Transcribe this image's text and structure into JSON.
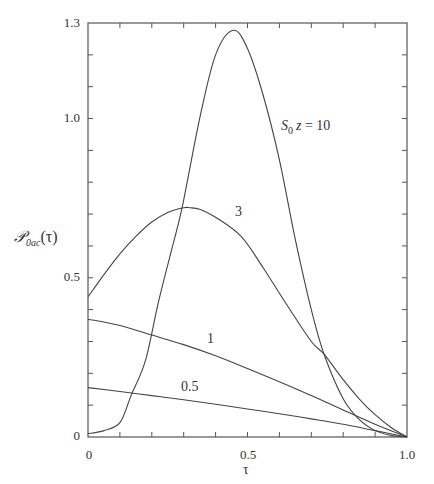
{
  "chart_data": {
    "type": "line",
    "title": "",
    "xlabel": "τ",
    "ylabel": "𝒫0ac(τ)",
    "ylabel_parts": {
      "main": "𝒫",
      "sub": "0ac",
      "arg": "(τ)"
    },
    "xlim": [
      0,
      1.0
    ],
    "ylim": [
      0,
      1.3
    ],
    "grid": false,
    "legend": "inline curve labels",
    "x_ticks_labeled": [
      "0",
      "0.5",
      "1.0"
    ],
    "y_ticks_labeled": [
      "0",
      "0.5",
      "1.0",
      "1.3"
    ],
    "minor_tick_step": 0.1,
    "series": [
      {
        "name": "S0z = 10",
        "label_parts": {
          "s": "S",
          "sub": "0",
          "z": "z",
          "eq": " = 10"
        },
        "x": [
          0,
          0.05,
          0.1,
          0.135,
          0.18,
          0.22,
          0.26,
          0.295,
          0.35,
          0.4,
          0.455,
          0.5,
          0.55,
          0.6,
          0.65,
          0.7,
          0.74,
          0.8,
          0.85,
          0.9,
          0.95,
          1.0
        ],
        "values": [
          0.01,
          0.02,
          0.045,
          0.13,
          0.24,
          0.42,
          0.58,
          0.72,
          1.0,
          1.2,
          1.277,
          1.22,
          1.07,
          0.87,
          0.62,
          0.4,
          0.26,
          0.12,
          0.055,
          0.02,
          0.005,
          0
        ]
      },
      {
        "name": "3",
        "x": [
          0,
          0.05,
          0.1,
          0.15,
          0.2,
          0.25,
          0.3,
          0.32,
          0.35,
          0.4,
          0.48,
          0.55,
          0.62,
          0.7,
          0.74,
          0.8,
          0.85,
          0.9,
          0.95,
          1.0
        ],
        "values": [
          0.44,
          0.51,
          0.575,
          0.63,
          0.675,
          0.705,
          0.72,
          0.72,
          0.715,
          0.69,
          0.63,
          0.53,
          0.42,
          0.3,
          0.26,
          0.18,
          0.12,
          0.07,
          0.03,
          0
        ]
      },
      {
        "name": "1",
        "x": [
          0,
          0.1,
          0.2,
          0.3,
          0.4,
          0.5,
          0.62,
          0.7,
          0.8,
          0.9,
          1.0
        ],
        "values": [
          0.37,
          0.35,
          0.32,
          0.29,
          0.255,
          0.215,
          0.165,
          0.13,
          0.085,
          0.04,
          0
        ]
      },
      {
        "name": "0.5",
        "x": [
          0,
          0.1,
          0.2,
          0.3,
          0.4,
          0.5,
          0.62,
          0.7,
          0.8,
          0.9,
          1.0
        ],
        "values": [
          0.155,
          0.143,
          0.13,
          0.117,
          0.103,
          0.088,
          0.07,
          0.057,
          0.04,
          0.02,
          0
        ]
      }
    ],
    "annotations": [
      {
        "text": "S0z = 10",
        "x": 0.6,
        "y": 0.99
      },
      {
        "text": "3",
        "x": 0.565,
        "y": 0.69
      },
      {
        "text": "1",
        "x": 0.57,
        "y": 0.31
      },
      {
        "text": "0.5",
        "x": 0.31,
        "y": 0.17
      }
    ]
  },
  "plot_box": {
    "left": 88,
    "right": 407,
    "top": 23,
    "bottom": 437
  }
}
